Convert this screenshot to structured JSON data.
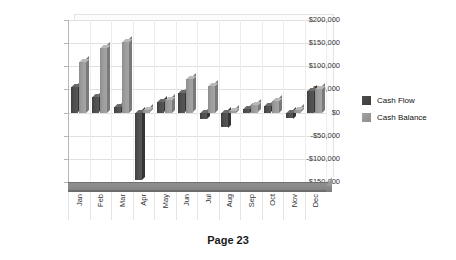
{
  "footer": {
    "page_label": "Page 23"
  },
  "legend": {
    "position": "right",
    "items": [
      {
        "label": "Cash Flow",
        "color": "#4a4a4a"
      },
      {
        "label": "Cash Balance",
        "color": "#9a9a9a"
      }
    ]
  },
  "axis": {
    "y_ticks": [
      "$200,000",
      "$150,000",
      "$100,000",
      "$50,000",
      "$0",
      "-$50,000",
      "-$100,000",
      "-$150,000"
    ],
    "x_ticks": [
      "Jan",
      "Feb",
      "Mar",
      "Apr",
      "May",
      "Jun",
      "Jul",
      "Aug",
      "Sep",
      "Oct",
      "Nov",
      "Dec"
    ]
  },
  "chart_data": {
    "type": "bar",
    "title": "",
    "subtitle": "",
    "xlabel": "",
    "ylabel": "",
    "ylim": [
      -150000,
      200000
    ],
    "ytick_step": 50000,
    "grid": true,
    "style": "3d-column",
    "legend_position": "right",
    "categories": [
      "Jan",
      "Feb",
      "Mar",
      "Apr",
      "May",
      "Jun",
      "Jul",
      "Aug",
      "Sep",
      "Oct",
      "Nov",
      "Dec"
    ],
    "series": [
      {
        "name": "Cash Flow",
        "color": "#4a4a4a",
        "values": [
          55000,
          33000,
          12000,
          -145000,
          22000,
          42000,
          -13000,
          -32000,
          8000,
          14000,
          -12000,
          47000
        ]
      },
      {
        "name": "Cash Balance",
        "color": "#9a9a9a",
        "values": [
          110000,
          140000,
          153000,
          5000,
          28000,
          72000,
          58000,
          4000,
          16000,
          25000,
          5000,
          52000
        ]
      }
    ]
  }
}
